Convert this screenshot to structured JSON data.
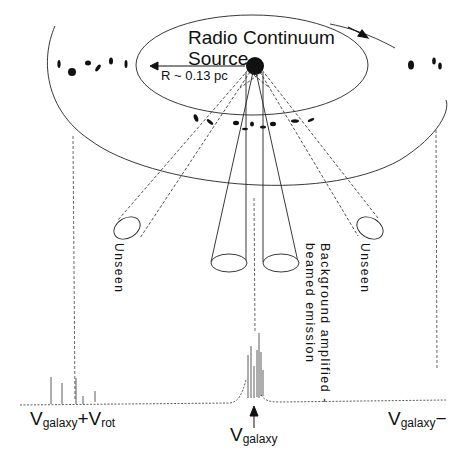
{
  "diagram": {
    "title_line1": "Radio Continuum",
    "title_line2": "Source",
    "radius_label": "R ~ 0.13 pc",
    "left_beam_label": "Unseen",
    "right_beam_label": "Unseen",
    "center_beam_label_line1": "Background amplified -",
    "center_beam_label_line2": "beamed emission",
    "spectrum_labels": {
      "left": {
        "main": "V",
        "sub": "galaxy",
        "suffix": "+V",
        "suffix_sub": "rot"
      },
      "center": {
        "main": "V",
        "sub": "galaxy"
      },
      "right": {
        "main": "V",
        "sub": "galaxy",
        "suffix": "−"
      }
    },
    "colors": {
      "ink": "#111111",
      "background": "#ffffff"
    }
  }
}
